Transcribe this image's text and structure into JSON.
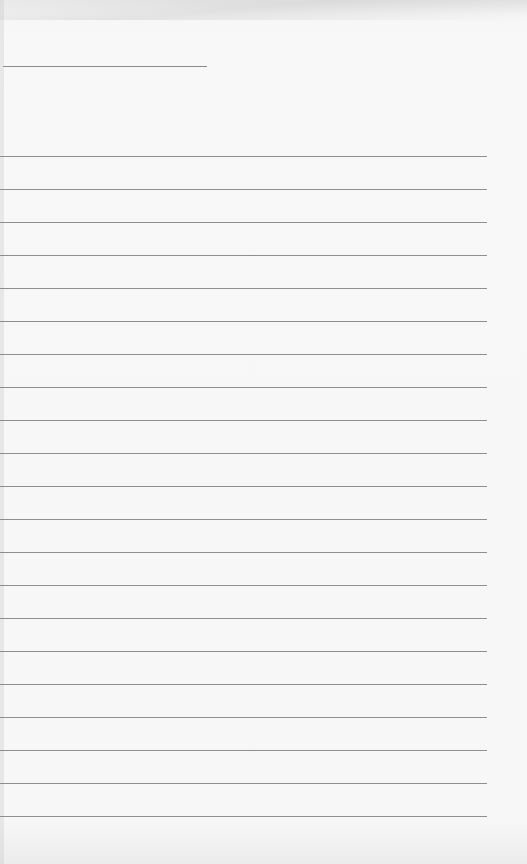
{
  "document": {
    "type": "lined-paper",
    "header_line": {
      "top": 66,
      "left": 3,
      "width": 204,
      "value": ""
    },
    "rule_lines": {
      "count": 21,
      "first_top": 156,
      "spacing": 33,
      "width": 487,
      "values": [
        "",
        "",
        "",
        "",
        "",
        "",
        "",
        "",
        "",
        "",
        "",
        "",
        "",
        "",
        "",
        "",
        "",
        "",
        "",
        "",
        ""
      ]
    },
    "colors": {
      "paper": "#f7f7f7",
      "line": "#8f8f8f"
    }
  }
}
